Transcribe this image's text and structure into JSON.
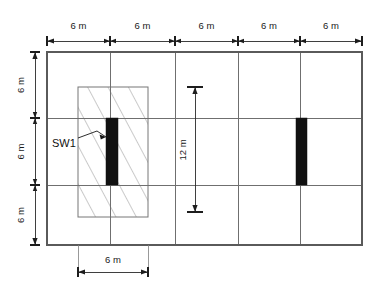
{
  "drawing": {
    "title": "Structural floor plan with shear wall SW1",
    "units": "m",
    "colors": {
      "grid": "#6f6f6f",
      "frame": "#5a5a5a",
      "wall_fill": "#111111",
      "dimension": "#1d1d1d",
      "background": "#ffffff"
    }
  },
  "top_dimensions": {
    "label": "top-bay-dimensions",
    "values": [
      "6 m",
      "6 m",
      "6 m",
      "6 m",
      "6 m"
    ]
  },
  "left_dimensions": {
    "label": "left-bay-dimensions",
    "values": [
      "6 m",
      "6 m",
      "6 m"
    ]
  },
  "interior_dimension": {
    "label": "interior-vertical-dimension",
    "value": "12 m"
  },
  "bottom_dimension": {
    "label": "bottom-wall-panel-dimension",
    "value": "6 m"
  },
  "annotations": {
    "shear_wall_label": "SW1"
  },
  "elements": {
    "hatched_panel_name": "hatched-wall-panel",
    "wall_left_name": "shear-wall-sw1",
    "wall_right_name": "shear-wall-right"
  }
}
